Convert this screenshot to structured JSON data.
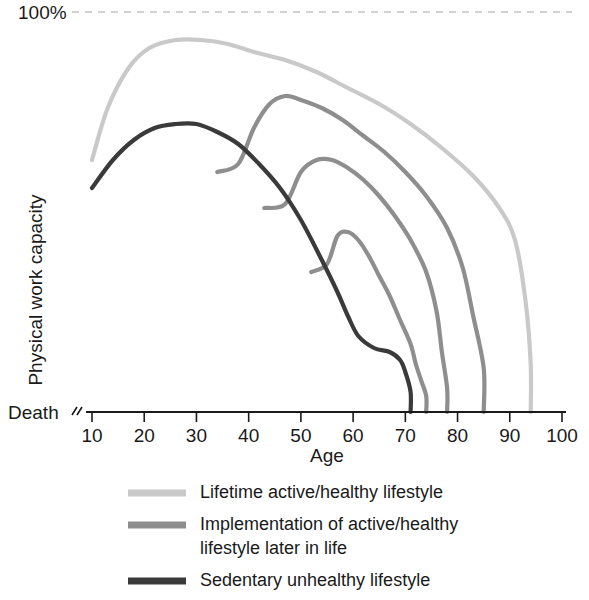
{
  "chart_data": {
    "type": "line",
    "title": "",
    "xlabel": "Age",
    "ylabel": "Physical work capacity",
    "xlim": [
      5,
      100
    ],
    "xticks": [
      10,
      20,
      30,
      40,
      50,
      60,
      70,
      80,
      90,
      100
    ],
    "xtick_labels": [
      "10",
      "20",
      "30",
      "40",
      "50",
      "60",
      "70",
      "80",
      "90",
      "100"
    ],
    "ylim": [
      0,
      100
    ],
    "ytop_label": "100%",
    "ybottom_label": "Death",
    "grid": false,
    "reference_line": {
      "label": "100%",
      "value": 100,
      "style": "dashed",
      "color": "#c4c4c4"
    },
    "legend_position": "bottom",
    "colors": {
      "active_healthy": "#c9c9c9",
      "implementation": "#8e8e8e",
      "sedentary": "#3a3a3a"
    },
    "series": [
      {
        "name": "Lifetime active/healthy lifestyle",
        "color": "#c9c9c9",
        "legend": true,
        "x": [
          10,
          13,
          17,
          21,
          26,
          31,
          36,
          41,
          47,
          53,
          59,
          65,
          71,
          77,
          83,
          88,
          91,
          93,
          94,
          94
        ],
        "y": [
          63,
          76,
          86,
          91,
          93,
          93,
          92,
          90,
          88,
          85,
          81,
          77,
          72,
          66,
          59,
          51,
          43,
          28,
          12,
          0
        ]
      },
      {
        "name": "Implementation of active/healthy lifestyle later in life (from age ~38)",
        "color": "#8e8e8e",
        "legend": false,
        "branch_age": 38,
        "x": [
          34,
          38,
          41,
          44,
          47,
          50,
          54,
          58,
          62,
          66,
          70,
          74,
          78,
          81,
          83,
          85,
          85
        ],
        "y": [
          60,
          62,
          71,
          77,
          79,
          78,
          76,
          73,
          69,
          65,
          60,
          54,
          46,
          36,
          24,
          11,
          0
        ]
      },
      {
        "name": "Implementation of active/healthy lifestyle later in life (from age ~47)",
        "color": "#8e8e8e",
        "legend": true,
        "branch_age": 47,
        "x": [
          43,
          47,
          50,
          53,
          56,
          59,
          62,
          65,
          68,
          71,
          74,
          76,
          77,
          78,
          78
        ],
        "y": [
          51,
          52,
          60,
          63,
          63,
          61,
          58,
          54,
          49,
          43,
          35,
          25,
          15,
          6,
          0
        ]
      },
      {
        "name": "Implementation of active/healthy lifestyle later in life (from age ~56)",
        "color": "#8e8e8e",
        "legend": false,
        "branch_age": 56,
        "x": [
          52,
          55,
          57,
          59,
          61,
          63,
          65,
          67,
          69,
          71,
          72,
          73,
          74,
          74
        ],
        "y": [
          35,
          37,
          44,
          45,
          43,
          39,
          34,
          29,
          23,
          17,
          12,
          8,
          4,
          0
        ]
      },
      {
        "name": "Sedentary unhealthy lifestyle",
        "color": "#3a3a3a",
        "legend": true,
        "x": [
          10,
          14,
          18,
          22,
          26,
          30,
          34,
          38,
          42,
          46,
          50,
          54,
          57,
          59,
          61,
          64,
          67,
          69,
          70,
          71,
          71
        ],
        "y": [
          56,
          63,
          68,
          71,
          72,
          72,
          70,
          67,
          62,
          56,
          48,
          38,
          30,
          24,
          19,
          16,
          15,
          13,
          10,
          5,
          0
        ]
      }
    ]
  },
  "axes": {
    "x_title": "Age",
    "y_title": "Physical work capacity",
    "top_label": "100%",
    "bottom_label": "Death",
    "tick_labels": [
      "10",
      "20",
      "30",
      "40",
      "50",
      "60",
      "70",
      "80",
      "90",
      "100"
    ],
    "axis_break_icon": "axis-break-icon"
  },
  "legend": {
    "items": [
      {
        "label": "Lifetime active/healthy lifestyle",
        "color": "#c9c9c9",
        "lines": [
          "Lifetime active/healthy lifestyle"
        ]
      },
      {
        "label": "Implementation of active/healthy lifestyle later in life",
        "color": "#8e8e8e",
        "lines": [
          "Implementation of active/healthy",
          "lifestyle later in life"
        ]
      },
      {
        "label": "Sedentary unhealthy lifestyle",
        "color": "#3a3a3a",
        "lines": [
          "Sedentary unhealthy lifestyle"
        ]
      }
    ]
  }
}
